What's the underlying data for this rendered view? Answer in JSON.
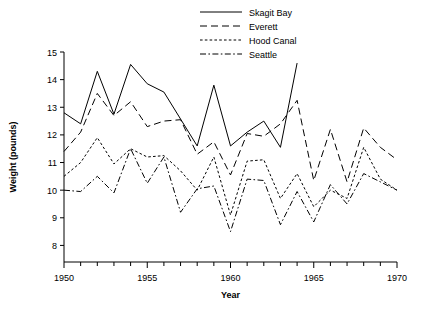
{
  "chart_data": {
    "type": "line",
    "title": "",
    "xlabel": "Year",
    "ylabel": "Weight (pounds)",
    "xlim": [
      1950,
      1970
    ],
    "ylim": [
      7.4,
      15
    ],
    "grid": false,
    "legend_position": "top-center",
    "x_ticks_major": [
      1950,
      1955,
      1960,
      1965,
      1970
    ],
    "x_tick_labels": [
      "1950",
      "1955",
      "1960",
      "1965",
      "1970"
    ],
    "x_ticks_minor_step": 1,
    "y_ticks": [
      8,
      9,
      10,
      11,
      12,
      13,
      14,
      15
    ],
    "y_tick_labels": [
      "8",
      "9",
      "10",
      "11",
      "12",
      "13",
      "14",
      "15"
    ],
    "series": [
      {
        "name": "Skagit Bay",
        "dash": "none",
        "x": [
          1950,
          1951,
          1952,
          1953,
          1954,
          1955,
          1956,
          1958,
          1959,
          1960,
          1961,
          1962,
          1963,
          1964
        ],
        "values": [
          12.8,
          12.4,
          14.3,
          12.75,
          14.55,
          13.85,
          13.55,
          11.6,
          13.8,
          11.6,
          12.1,
          12.5,
          11.55,
          14.6
        ]
      },
      {
        "name": "Everett",
        "dash": "dashed",
        "x": [
          1950,
          1951,
          1952,
          1953,
          1954,
          1955,
          1956,
          1957,
          1958,
          1959,
          1960,
          1961,
          1962,
          1963,
          1964,
          1965,
          1966,
          1967,
          1968,
          1969,
          1970
        ],
        "values": [
          11.4,
          12.1,
          13.5,
          12.7,
          13.2,
          12.3,
          12.5,
          12.55,
          11.3,
          11.75,
          10.55,
          12.05,
          11.95,
          12.4,
          13.25,
          10.35,
          12.2,
          10.3,
          12.25,
          11.55,
          11.1
        ]
      },
      {
        "name": "Hood Canal",
        "dash": "dotted",
        "x": [
          1950,
          1951,
          1952,
          1953,
          1954,
          1955,
          1956,
          1957,
          1958,
          1959,
          1960,
          1961,
          1962,
          1963,
          1964,
          1965,
          1966,
          1967,
          1968,
          1969,
          1970
        ],
        "values": [
          10.5,
          11.0,
          11.9,
          10.95,
          11.5,
          11.2,
          11.25,
          10.7,
          10.0,
          11.2,
          9.1,
          11.05,
          11.1,
          9.7,
          10.6,
          9.4,
          10.0,
          9.7,
          11.55,
          10.4,
          10.0
        ]
      },
      {
        "name": "Seattle",
        "dash": "dashdot",
        "x": [
          1950,
          1951,
          1952,
          1953,
          1954,
          1955,
          1956,
          1957,
          1958,
          1959,
          1960,
          1961,
          1962,
          1963,
          1964,
          1965,
          1966,
          1967,
          1968,
          1969,
          1970
        ],
        "values": [
          10.0,
          9.95,
          10.5,
          9.9,
          11.5,
          10.25,
          11.2,
          9.2,
          10.05,
          10.15,
          8.5,
          10.4,
          10.35,
          8.75,
          9.95,
          8.85,
          10.2,
          9.5,
          10.6,
          10.3,
          10.0
        ]
      }
    ]
  },
  "legend": {
    "items": [
      {
        "label": "Skagit Bay"
      },
      {
        "label": "Everett"
      },
      {
        "label": "Hood Canal"
      },
      {
        "label": "Seattle"
      }
    ]
  }
}
